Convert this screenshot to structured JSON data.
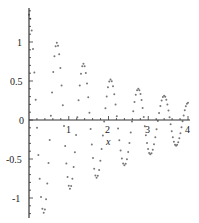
{
  "chart_data": {
    "type": "scatter",
    "title": "",
    "xlabel": "x",
    "ylabel": "",
    "xlim": [
      0,
      4
    ],
    "ylim": [
      -1.2,
      1.4
    ],
    "grid": false,
    "legend": null,
    "x_ticks": [
      "1",
      "2",
      "3",
      "4"
    ],
    "y_ticks": [
      "1",
      "0.5",
      "0",
      "-0.5",
      "-1"
    ],
    "point_color": "#777777",
    "axis_color": "#333333",
    "series": [
      {
        "name": "damped oscillation",
        "style": "dotted points",
        "description": "Damped oscillation: starts at ~1.35 at x=0, alternating peaks/troughs with decaying amplitude, period ~0.7",
        "extrema": [
          {
            "x": 0.0,
            "y": 1.35
          },
          {
            "x": 0.37,
            "y": -1.19
          },
          {
            "x": 0.7,
            "y": 0.99
          },
          {
            "x": 1.03,
            "y": -0.88
          },
          {
            "x": 1.37,
            "y": 0.72
          },
          {
            "x": 1.7,
            "y": -0.74
          },
          {
            "x": 2.05,
            "y": 0.52
          },
          {
            "x": 2.4,
            "y": -0.58
          },
          {
            "x": 2.75,
            "y": 0.4
          },
          {
            "x": 3.05,
            "y": -0.44
          },
          {
            "x": 3.4,
            "y": 0.31
          },
          {
            "x": 3.7,
            "y": -0.33
          },
          {
            "x": 4.0,
            "y": 0.22
          }
        ]
      }
    ]
  }
}
